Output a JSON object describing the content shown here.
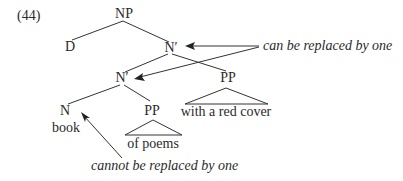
{
  "example_number": "(44)",
  "tree": {
    "root": "NP",
    "d": "D",
    "n_bar_top": "N′",
    "n_bar_low": "N′",
    "pp_right": "PP",
    "n": "N",
    "pp_low": "PP",
    "word_book": "book",
    "phrase_with": "with a red cover",
    "phrase_of": "of poems"
  },
  "annotations": {
    "can": "can be replaced by one",
    "cannot": "cannot be replaced by one"
  }
}
